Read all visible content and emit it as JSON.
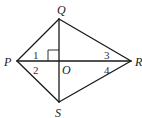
{
  "diagram": {
    "type": "geometry-kite",
    "vertices": {
      "Q": {
        "label": "Q",
        "x": 59,
        "y": 19,
        "lx": 57,
        "ly": 14
      },
      "P": {
        "label": "P",
        "x": 17,
        "y": 61,
        "lx": 4,
        "ly": 66
      },
      "R": {
        "label": "R",
        "x": 131,
        "y": 61,
        "lx": 135,
        "ly": 66
      },
      "S": {
        "label": "S",
        "x": 59,
        "y": 102,
        "lx": 55,
        "ly": 117
      },
      "O": {
        "label": "O",
        "x": 59,
        "y": 61,
        "lx": 62,
        "ly": 74
      }
    },
    "angles": [
      {
        "label": "1",
        "x": 33,
        "y": 59
      },
      {
        "label": "2",
        "x": 33,
        "y": 74
      },
      {
        "label": "3",
        "x": 104,
        "y": 59
      },
      {
        "label": "4",
        "x": 104,
        "y": 74
      }
    ],
    "segments": [
      "PQ",
      "QR",
      "RS",
      "SP",
      "PR",
      "QS"
    ],
    "right_angle_at": "O",
    "stroke_color": "#1a1a1a"
  }
}
